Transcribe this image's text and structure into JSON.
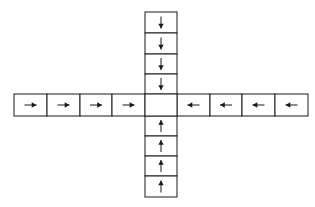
{
  "diagram": {
    "center_cell": {
      "arrow": "none"
    },
    "arms": {
      "top": {
        "cells": 4,
        "arrow": "down"
      },
      "left": {
        "cells": 4,
        "arrow": "right"
      },
      "right": {
        "cells": 4,
        "arrow": "left"
      },
      "bottom": {
        "cells": 4,
        "arrow": "up"
      }
    },
    "colors": {
      "stroke": "#1a1a1a",
      "background": "#ffffff"
    }
  }
}
